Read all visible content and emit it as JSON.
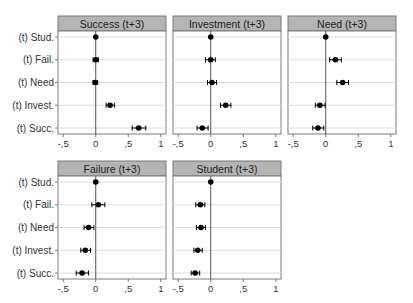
{
  "chart_data": [
    {
      "type": "scatter",
      "subtype": "coefficient-plot",
      "title": "Success (t+3)",
      "categories": [
        "(t) Stud.",
        "(t) Fail.",
        "(t) Need",
        "(t) Invest.",
        "(t) Succ."
      ],
      "values": [
        0,
        0.0,
        -0.01,
        0.22,
        0.66
      ],
      "ci_low": [
        null,
        -0.04,
        -0.04,
        0.16,
        0.56
      ],
      "ci_high": [
        null,
        0.04,
        0.03,
        0.29,
        0.77
      ],
      "xticks": [
        "-,5",
        "0",
        ",5",
        "1"
      ],
      "xlim": [
        -0.58,
        1.08
      ],
      "grid": true,
      "reference_line": 0
    },
    {
      "type": "scatter",
      "subtype": "coefficient-plot",
      "title": "Investment (t+3)",
      "categories": [
        "(t) Stud.",
        "(t) Fail.",
        "(t) Need",
        "(t) Invest.",
        "(t) Succ."
      ],
      "values": [
        0,
        0.0,
        0.02,
        0.23,
        -0.13
      ],
      "ci_low": [
        null,
        -0.08,
        -0.05,
        0.15,
        -0.21
      ],
      "ci_high": [
        null,
        0.07,
        0.09,
        0.31,
        -0.04
      ],
      "xticks": [
        "-,5",
        "0",
        ",5",
        "1"
      ],
      "xlim": [
        -0.58,
        1.08
      ],
      "grid": true,
      "reference_line": 0
    },
    {
      "type": "scatter",
      "subtype": "coefficient-plot",
      "title": "Need (t+3)",
      "categories": [
        "(t) Stud.",
        "(t) Fail.",
        "(t) Need",
        "(t) Invest.",
        "(t) Succ."
      ],
      "values": [
        0,
        0.15,
        0.26,
        -0.09,
        -0.12
      ],
      "ci_low": [
        null,
        0.06,
        0.17,
        -0.16,
        -0.2
      ],
      "ci_high": [
        null,
        0.24,
        0.35,
        -0.01,
        -0.03
      ],
      "xticks": [
        "-,5",
        "0",
        ",5",
        "1"
      ],
      "xlim": [
        -0.58,
        1.08
      ],
      "grid": true,
      "reference_line": 0
    },
    {
      "type": "scatter",
      "subtype": "coefficient-plot",
      "title": "Failure (t+3)",
      "categories": [
        "(t) Stud.",
        "(t) Fail.",
        "(t) Need",
        "(t) Invest.",
        "(t) Succ."
      ],
      "values": [
        0,
        0.04,
        -0.11,
        -0.16,
        -0.21
      ],
      "ci_low": [
        null,
        -0.06,
        -0.18,
        -0.23,
        -0.3
      ],
      "ci_high": [
        null,
        0.14,
        -0.03,
        -0.08,
        -0.11
      ],
      "xticks": [
        "-,5",
        "0",
        ",5",
        "1"
      ],
      "xlim": [
        -0.58,
        1.08
      ],
      "grid": true,
      "reference_line": 0
    },
    {
      "type": "scatter",
      "subtype": "coefficient-plot",
      "title": "Student (t+3)",
      "categories": [
        "(t) Stud.",
        "(t) Fail.",
        "(t) Need",
        "(t) Invest.",
        "(t) Succ."
      ],
      "values": [
        0,
        -0.16,
        -0.15,
        -0.2,
        -0.24
      ],
      "ci_low": [
        null,
        -0.23,
        -0.22,
        -0.26,
        -0.3
      ],
      "ci_high": [
        null,
        -0.09,
        -0.08,
        -0.13,
        -0.17
      ],
      "xticks": [
        "-,5",
        "0",
        ",5",
        "1"
      ],
      "xlim": [
        -0.58,
        1.08
      ],
      "grid": true,
      "reference_line": 0
    }
  ],
  "colors": {
    "header_fill": "#b4b4b4",
    "frame": "#7a7a7a",
    "grid": "#dcdcdc",
    "marker": "#000000",
    "text": "#333333"
  }
}
